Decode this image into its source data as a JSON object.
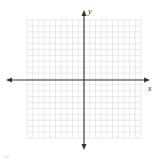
{
  "diagram": {
    "type": "coordinate-plane",
    "x_axis_label": "x",
    "y_axis_label": "y",
    "grid": {
      "columns": 20,
      "rows": 20,
      "color": "#d8d8d8"
    },
    "axis_color": "#333333",
    "footer_mark": "(a)"
  }
}
